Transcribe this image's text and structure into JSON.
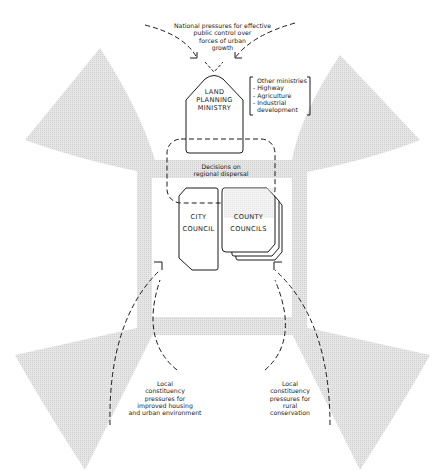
{
  "diagram": {
    "top_pressure": {
      "lines": [
        "National pressures for effective",
        "public control over",
        "forces of urban",
        "growth"
      ]
    },
    "land_planning_ministry": {
      "lines": [
        "LAND",
        "PLANNING",
        "MINISTRY"
      ]
    },
    "other_ministries": {
      "title": "Other ministries",
      "items": [
        "- Highway",
        "- Agriculture",
        "- Industrial",
        "  development"
      ]
    },
    "decisions": {
      "lines": [
        "Decisions on",
        "regional dispersal"
      ]
    },
    "city_council": {
      "lines": [
        "CITY",
        "COUNCIL"
      ]
    },
    "county_councils": {
      "lines": [
        "COUNTY",
        "COUNCILS"
      ]
    },
    "left_pressure": {
      "lines": [
        "Local",
        "constituency",
        "pressures for",
        "improved housing",
        "and urban environment"
      ]
    },
    "right_pressure": {
      "lines": [
        "Local",
        "constituency",
        "pressures for",
        "rural",
        "conservation"
      ]
    },
    "colors": {
      "stroke": "#1a1a1a",
      "shade": "#dcdcdc",
      "background": "#ffffff"
    }
  }
}
